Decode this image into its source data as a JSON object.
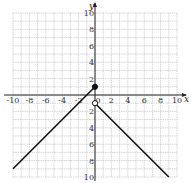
{
  "chart_data": {
    "type": "line",
    "title": "",
    "xlabel": "x",
    "ylabel": "y",
    "xlim": [
      -10,
      10
    ],
    "ylim": [
      -10,
      10
    ],
    "grid": true,
    "x_ticks": [
      -10,
      -8,
      -6,
      -4,
      -2,
      0,
      2,
      4,
      6,
      8,
      10
    ],
    "y_ticks": [
      -10,
      -8,
      -6,
      -4,
      -2,
      2,
      4,
      6,
      8,
      10
    ],
    "x_tick_labels": [
      "-10",
      "-8",
      "-6",
      "-4",
      "-2",
      "0",
      "2",
      "4",
      "6",
      "8",
      "10"
    ],
    "y_tick_labels": [
      "10",
      "8",
      "6",
      "4",
      "2",
      "2",
      "4",
      "6",
      "8",
      "10"
    ],
    "series": [
      {
        "name": "left piece",
        "points": [
          [
            -10,
            -9
          ],
          [
            0,
            1
          ]
        ],
        "endpoint": {
          "x": 0,
          "y": 1,
          "style": "closed"
        }
      },
      {
        "name": "right piece",
        "points": [
          [
            0,
            -1
          ],
          [
            9,
            -10
          ]
        ],
        "endpoint": {
          "x": 0,
          "y": -1,
          "style": "open"
        }
      }
    ]
  },
  "labels": {
    "x_axis": "x",
    "y_axis": "y"
  }
}
